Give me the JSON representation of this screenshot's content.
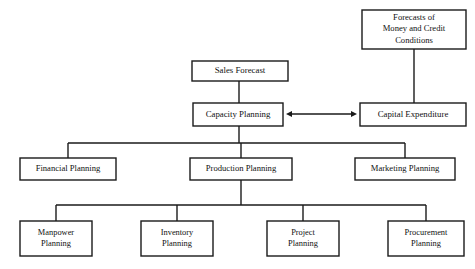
{
  "diagram": {
    "type": "org-flowchart",
    "canvas": {
      "width": 475,
      "height": 269
    },
    "colors": {
      "background": "#ffffff",
      "box_fill": "#ffffff",
      "stroke": "#1a1a1a",
      "text": "#111111"
    },
    "nodes": [
      {
        "id": "forecasts",
        "lines": [
          "Forecasts of",
          "Money and Credit",
          "Conditions"
        ],
        "x": 362,
        "y": 10,
        "w": 104,
        "h": 39,
        "font_size": 8.6
      },
      {
        "id": "sales_forecast",
        "lines": [
          "Sales Forecast"
        ],
        "x": 192,
        "y": 61,
        "w": 96,
        "h": 20,
        "font_size": 8.8
      },
      {
        "id": "capacity_planning",
        "lines": [
          "Capacity Planning"
        ],
        "x": 193,
        "y": 103,
        "w": 90,
        "h": 23,
        "font_size": 8.8
      },
      {
        "id": "capital_expenditure",
        "lines": [
          "Capital Expenditure"
        ],
        "x": 360,
        "y": 103,
        "w": 106,
        "h": 23,
        "font_size": 8.8
      },
      {
        "id": "financial_planning",
        "lines": [
          "Financial Planning"
        ],
        "x": 20,
        "y": 158,
        "w": 96,
        "h": 22,
        "font_size": 8.6
      },
      {
        "id": "production_planning",
        "lines": [
          "Production Planning"
        ],
        "x": 190,
        "y": 158,
        "w": 102,
        "h": 22,
        "font_size": 8.6
      },
      {
        "id": "marketing_planning",
        "lines": [
          "Marketing Planning"
        ],
        "x": 355,
        "y": 158,
        "w": 100,
        "h": 22,
        "font_size": 8.6
      },
      {
        "id": "manpower_planning",
        "lines": [
          "Manpower",
          "Planning"
        ],
        "x": 20,
        "y": 221,
        "w": 72,
        "h": 35,
        "font_size": 8.4
      },
      {
        "id": "inventory_planning",
        "lines": [
          "Inventory",
          "Planning"
        ],
        "x": 141,
        "y": 221,
        "w": 72,
        "h": 35,
        "font_size": 8.4
      },
      {
        "id": "project_planning",
        "lines": [
          "Project",
          "Planning"
        ],
        "x": 267,
        "y": 221,
        "w": 72,
        "h": 35,
        "font_size": 8.4
      },
      {
        "id": "procurement_planning",
        "lines": [
          "Procurement",
          "Planning"
        ],
        "x": 388,
        "y": 221,
        "w": 76,
        "h": 35,
        "font_size": 8.4
      }
    ],
    "connectors": [
      {
        "id": "forecasts-to-capital",
        "from": "forecasts",
        "to": "capital_expenditure",
        "path": "M 414 49 L 414 103"
      },
      {
        "id": "sales-to-capacity",
        "from": "sales_forecast",
        "to": "capacity_planning",
        "path": "M 239 81 L 239 103"
      },
      {
        "id": "capacity-to-bus",
        "from": "capacity_planning",
        "to": "row3-bus",
        "path": "M 239 126 L 239 143"
      },
      {
        "id": "row3-bus",
        "from": "capacity_planning",
        "to": "row3-nodes",
        "path": "M 68 143 L 405 143"
      },
      {
        "id": "bus-to-financial",
        "from": "row3-bus",
        "to": "financial_planning",
        "path": "M 68 143 L 68 158"
      },
      {
        "id": "bus-to-production",
        "from": "row3-bus",
        "to": "production_planning",
        "path": "M 241 143 L 241 158"
      },
      {
        "id": "bus-to-marketing",
        "from": "row3-bus",
        "to": "marketing_planning",
        "path": "M 405 143 L 405 158"
      },
      {
        "id": "production-to-bus",
        "from": "production_planning",
        "to": "row4-bus",
        "path": "M 241 180 L 241 205"
      },
      {
        "id": "row4-bus",
        "from": "production_planning",
        "to": "row4-nodes",
        "path": "M 56 205 L 426 205"
      },
      {
        "id": "bus-to-manpower",
        "from": "row4-bus",
        "to": "manpower_planning",
        "path": "M 56 205 L 56 221"
      },
      {
        "id": "bus-to-inventory",
        "from": "row4-bus",
        "to": "inventory_planning",
        "path": "M 177 205 L 177 221"
      },
      {
        "id": "bus-to-project",
        "from": "row4-bus",
        "to": "project_planning",
        "path": "M 303 205 L 303 221"
      },
      {
        "id": "bus-to-procurement",
        "from": "row4-bus",
        "to": "procurement_planning",
        "path": "M 426 205 L 426 221"
      }
    ],
    "arrows": [
      {
        "id": "capacity-capital-bidirectional",
        "from": "capacity_planning",
        "to": "capital_expenditure",
        "direction": "both",
        "x1": 286,
        "x2": 357,
        "y": 114
      }
    ]
  }
}
